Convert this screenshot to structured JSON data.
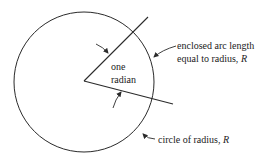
{
  "diagram": {
    "labels": {
      "angle_line1": "one",
      "angle_line2": "radian",
      "arc_line1": "enclosed arc length",
      "arc_line2_prefix": "equal to radius, ",
      "arc_line2_var": "R",
      "circle_prefix": "circle of radius, ",
      "circle_var": "R"
    },
    "geometry": {
      "circle": {
        "cx": 84,
        "cy": 82,
        "r": 70
      },
      "vertex": {
        "x": 84,
        "y": 81
      },
      "upper_ray_end": {
        "x": 148,
        "y": 17
      },
      "lower_ray_end": {
        "x": 173,
        "y": 104
      }
    },
    "colors": {
      "stroke": "#2a2a2a",
      "text": "#222222",
      "background": "#ffffff"
    }
  }
}
